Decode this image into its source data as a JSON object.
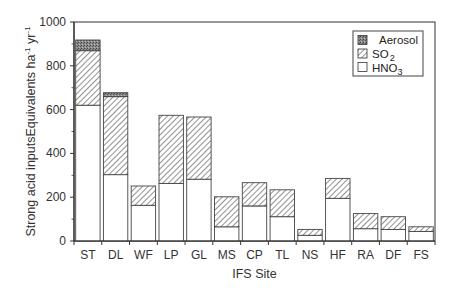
{
  "chart_data": {
    "type": "bar",
    "stacked": true,
    "title": "",
    "xlabel": "IFS Site",
    "ylabel": "Strong acid inputsEquivalents ha⁻¹ yr⁻¹",
    "ylabel_parts": {
      "main": "Strong acid inputsEquivalents ha",
      "sup1": "-1",
      "mid": " yr",
      "sup2": "-1"
    },
    "ylim": [
      0,
      1000
    ],
    "yticks": [
      0,
      200,
      400,
      600,
      800,
      1000
    ],
    "grid": false,
    "legend_position": "upper right",
    "categories": [
      "ST",
      "DL",
      "WF",
      "LP",
      "GL",
      "MS",
      "CP",
      "TL",
      "NS",
      "HF",
      "RA",
      "DF",
      "FS"
    ],
    "series": [
      {
        "name": "HNO3",
        "label_main": "HNO",
        "label_sub": "3",
        "pattern": "white",
        "values": [
          620,
          303,
          163,
          263,
          282,
          65,
          160,
          111,
          26,
          195,
          56,
          53,
          44
        ]
      },
      {
        "name": "SO2",
        "label_main": "SO",
        "label_sub": "2",
        "pattern": "hatch",
        "values": [
          249,
          356,
          88,
          311,
          284,
          137,
          106,
          123,
          27,
          91,
          69,
          58,
          21
        ]
      },
      {
        "name": "Aerosol",
        "label_main": "Aerosol",
        "label_sub": "",
        "pattern": "dark-stipple",
        "values": [
          49,
          18,
          0,
          0,
          0,
          0,
          0,
          0,
          0,
          0,
          0,
          0,
          0
        ]
      }
    ],
    "totals": [
      918,
      677,
      251,
      574,
      566,
      202,
      266,
      234,
      53,
      286,
      125,
      111,
      65
    ]
  },
  "legend_order": [
    "Aerosol",
    "SO2",
    "HNO3"
  ],
  "colors": {
    "axis": "#333333",
    "bar_outline": "#444444",
    "hatch": "#555555",
    "aerosol_fill": "#7a7a7a",
    "hno3_fill": "#ffffff"
  }
}
